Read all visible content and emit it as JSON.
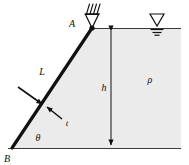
{
  "figure": {
    "type": "engineering-free-body-diagram",
    "colors": {
      "fluid_fill": "#ebebeb",
      "gate_stroke": "#111111",
      "line_stroke": "#3a3a3a",
      "label_color": "#111111",
      "background": "#ffffff"
    },
    "labels": {
      "point_a": "A",
      "point_b": "B",
      "length_l": "L",
      "thickness_t": "t",
      "angle_theta": "θ",
      "height_h": "h",
      "density_rho": "ρ"
    },
    "icons": {
      "pin_support": "pin-support-icon",
      "water_surface": "water-surface-level-icon",
      "hatching": "fixed-support-hatching-icon",
      "dimension_h": "dimension-arrow-icon",
      "force_arrow": "force-arrow-icon",
      "leader_arrow": "leader-arrow-icon"
    },
    "geometry": {
      "point_a": [
        92,
        28
      ],
      "point_b": [
        12,
        148
      ],
      "gate_length_px": 144,
      "water_line_y": 28,
      "ground_line_y": 148,
      "dimension_x": 111,
      "fluid_right_x": 181
    }
  }
}
